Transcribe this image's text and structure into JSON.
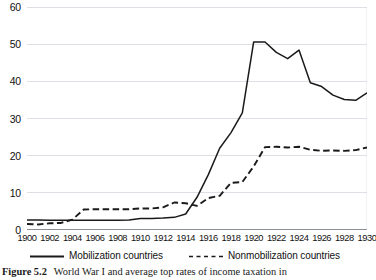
{
  "chart_data": {
    "type": "line",
    "title": "",
    "xlabel": "",
    "ylabel": "",
    "xlim": [
      1900,
      1930
    ],
    "ylim": [
      0,
      60
    ],
    "yticks": [
      0,
      10,
      20,
      30,
      40,
      50,
      60
    ],
    "xticks": [
      1900,
      1902,
      1904,
      1906,
      1908,
      1910,
      1912,
      1914,
      1916,
      1918,
      1920,
      1922,
      1924,
      1926,
      1928,
      1930
    ],
    "grid": "horizontal",
    "legend_position": "bottom",
    "x": [
      1900,
      1901,
      1902,
      1903,
      1904,
      1905,
      1906,
      1907,
      1908,
      1909,
      1910,
      1911,
      1912,
      1913,
      1914,
      1915,
      1916,
      1917,
      1918,
      1919,
      1920,
      1921,
      1922,
      1923,
      1924,
      1925,
      1926,
      1927,
      1928,
      1929,
      1930
    ],
    "series": [
      {
        "name": "Mobilization countries",
        "style": "solid",
        "color": "#1a1a1a",
        "values": [
          2.7,
          2.7,
          2.6,
          2.6,
          2.6,
          2.6,
          2.6,
          2.6,
          2.6,
          2.7,
          3.1,
          3.1,
          3.2,
          3.4,
          4.3,
          8.8,
          14.9,
          22.0,
          26.2,
          31.5,
          50.6,
          50.6,
          47.8,
          46.1,
          48.4,
          39.6,
          38.6,
          36.3,
          35.1,
          34.9,
          36.9
        ]
      },
      {
        "name": "Nonmobilization countries",
        "style": "dashed",
        "color": "#1a1a1a",
        "values": [
          1.6,
          1.5,
          1.8,
          1.9,
          2.8,
          5.5,
          5.6,
          5.6,
          5.6,
          5.6,
          5.8,
          5.8,
          6.1,
          7.4,
          7.2,
          6.5,
          8.6,
          9.2,
          12.7,
          12.9,
          17.1,
          22.3,
          22.4,
          22.2,
          22.4,
          21.6,
          21.3,
          21.4,
          21.3,
          21.5,
          22.2
        ]
      }
    ],
    "legend": [
      {
        "label": "Mobilization countries",
        "style": "solid"
      },
      {
        "label": "Nonmobilization countries",
        "style": "dashed"
      }
    ]
  },
  "caption": {
    "number": "Figure 5.2",
    "text": "World War I and average top rates of income taxation in"
  },
  "colors": {
    "line": "#1a1a1a",
    "grid": "#cfd4da",
    "axis": "#8a8f96",
    "background": "#ffffff"
  }
}
